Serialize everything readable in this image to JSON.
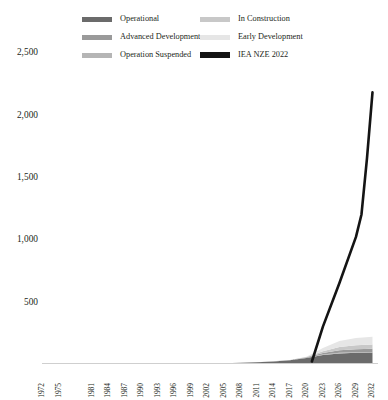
{
  "legend": {
    "rows": [
      [
        {
          "label": "Operational",
          "color": "#6b6b6b",
          "style": "band"
        },
        {
          "label": "In Construction",
          "color": "#c8c8c8",
          "style": "band"
        }
      ],
      [
        {
          "label": "Advanced Development",
          "color": "#9a9a9a",
          "style": "band"
        },
        {
          "label": "Early Development",
          "color": "#e6e6e6",
          "style": "band"
        }
      ],
      [
        {
          "label": "Operation Suspended",
          "color": "#b5b5b5",
          "style": "band"
        },
        {
          "label": "IEA NZE 2022",
          "color": "#141414",
          "style": "line"
        }
      ]
    ]
  },
  "chart_data": {
    "type": "area",
    "title": "",
    "xlabel": "",
    "ylabel": "",
    "stacked": true,
    "grid": false,
    "legend_position": "top",
    "ylim": [
      0,
      2600
    ],
    "yticks": [
      500,
      1000,
      1500,
      2000,
      2500
    ],
    "ytick_labels": [
      "500",
      "1,500 placeholder",
      "x"
    ],
    "y_tick_text": [
      "2,500",
      "2,000",
      "1,500",
      "1,000",
      "500"
    ],
    "y_tick_values": [
      2500,
      2000,
      1500,
      1000,
      500
    ],
    "xlim": [
      1972,
      2033
    ],
    "xtick_labels": [
      "1972",
      "1975",
      "1981",
      "1984",
      "1987",
      "1990",
      "1993",
      "1996",
      "1999",
      "2002",
      "2005",
      "2008",
      "2011",
      "2014",
      "2017",
      "2020",
      "2023",
      "2026",
      "2029",
      "2032"
    ],
    "xtick_values": [
      1972,
      1975,
      1981,
      1984,
      1987,
      1990,
      1993,
      1996,
      1999,
      2002,
      2005,
      2008,
      2011,
      2014,
      2017,
      2020,
      2023,
      2026,
      2029,
      2032
    ],
    "x": [
      1972,
      1975,
      1978,
      1981,
      1984,
      1987,
      1990,
      1993,
      1996,
      1999,
      2002,
      2005,
      2008,
      2011,
      2014,
      2017,
      2020,
      2023,
      2026,
      2029,
      2032
    ],
    "series": [
      {
        "name": "Operational",
        "color": "#6b6b6b",
        "values": [
          0,
          0,
          0,
          0,
          0,
          1,
          1,
          2,
          2,
          3,
          5,
          7,
          10,
          14,
          20,
          30,
          48,
          72,
          85,
          90,
          92
        ]
      },
      {
        "name": "Operation Suspended",
        "color": "#b5b5b5",
        "values": [
          0,
          0,
          0,
          0,
          0,
          0,
          0,
          0,
          0,
          0,
          0,
          0,
          1,
          1,
          2,
          2,
          3,
          4,
          5,
          5,
          5
        ]
      },
      {
        "name": "Advanced Development",
        "color": "#9a9a9a",
        "values": [
          0,
          0,
          0,
          0,
          0,
          0,
          0,
          0,
          0,
          0,
          0,
          0,
          0,
          0,
          0,
          1,
          3,
          12,
          20,
          24,
          26
        ]
      },
      {
        "name": "In Construction",
        "color": "#c8c8c8",
        "values": [
          0,
          0,
          0,
          0,
          0,
          0,
          0,
          0,
          0,
          0,
          0,
          0,
          0,
          0,
          0,
          0,
          2,
          14,
          26,
          32,
          34
        ]
      },
      {
        "name": "Early Development",
        "color": "#e6e6e6",
        "values": [
          0,
          0,
          0,
          0,
          0,
          0,
          0,
          0,
          0,
          0,
          0,
          0,
          0,
          0,
          0,
          0,
          2,
          26,
          48,
          58,
          62
        ]
      }
    ],
    "reference_line": {
      "name": "IEA NZE 2022",
      "color": "#141414",
      "width": 2.6,
      "x": [
        2021,
        2023,
        2026,
        2029,
        2030,
        2031,
        2032
      ],
      "values": [
        20,
        300,
        650,
        1020,
        1200,
        1650,
        2180
      ]
    }
  }
}
